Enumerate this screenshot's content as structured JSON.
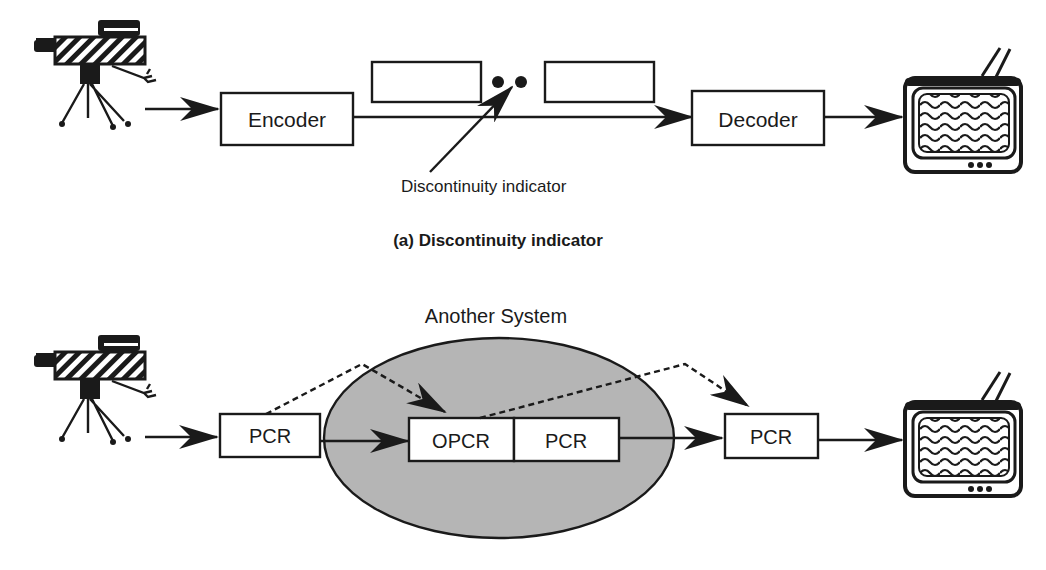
{
  "diagram_a": {
    "encoder_label": "Encoder",
    "decoder_label": "Decoder",
    "pointer_label": "Discontinuity indicator",
    "caption": "(a)  Discontinuity indicator"
  },
  "diagram_b": {
    "system_label": "Another System",
    "pcr_in_label": "PCR",
    "opcr_label": "OPCR",
    "pcr_mid_label": "PCR",
    "pcr_out_label": "PCR"
  },
  "colors": {
    "ink": "#1a1a1a",
    "ellipse_fill": "#b5b5b5"
  },
  "icons": {
    "source": "video-camera-icon",
    "sink": "television-icon"
  }
}
